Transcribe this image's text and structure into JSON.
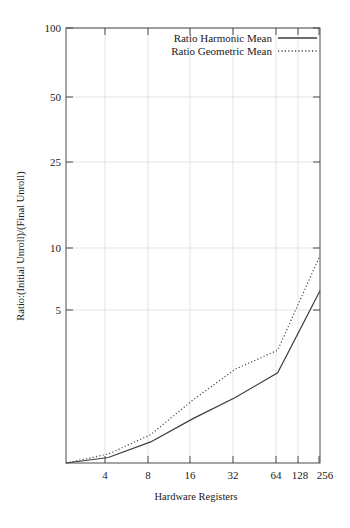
{
  "chart_data": {
    "type": "line",
    "title": "",
    "xlabel": "Hardware Registers",
    "ylabel": "Ratio:(Initial Unroll)/(Final Unroll)",
    "xscale": "log",
    "yscale": "log",
    "xlim": [
      4,
      256
    ],
    "ylim": [
      1,
      100
    ],
    "grid": true,
    "legend_position": "top-right",
    "xticks": [
      "4",
      "8",
      "16",
      "32",
      "64",
      "128",
      "256"
    ],
    "xtick_values": [
      4,
      8,
      16,
      32,
      64,
      128,
      256
    ],
    "yticks": [
      "5",
      "10",
      "25",
      "50",
      "100"
    ],
    "ytick_values": [
      5,
      10,
      25,
      50,
      100
    ],
    "x": [
      4,
      8,
      16,
      32,
      64,
      128,
      256
    ],
    "series": [
      {
        "name": "Ratio Harmonic Mean",
        "style": "solid",
        "color": "#3c3c3c",
        "values": [
          1.0,
          1.06,
          1.25,
          1.6,
          2.0,
          2.6,
          6.2
        ]
      },
      {
        "name": "Ratio Geometric Mean",
        "style": "dotted",
        "color": "#4a4a4a",
        "values": [
          1.0,
          1.1,
          1.35,
          1.95,
          2.7,
          3.3,
          9.0
        ]
      }
    ]
  },
  "legend": {
    "entries": [
      {
        "label": "Ratio Harmonic Mean",
        "style": "solid"
      },
      {
        "label": "Ratio Geometric Mean",
        "style": "dotted"
      }
    ]
  },
  "axes": {
    "y_title": "Ratio:(Initial Unroll)/(Final Unroll)",
    "x_title": "Hardware Registers",
    "y_labels": [
      "100",
      "50",
      "25",
      "10",
      "5"
    ],
    "x_labels": [
      "4",
      "8",
      "16",
      "32",
      "64",
      "128",
      "256"
    ]
  }
}
